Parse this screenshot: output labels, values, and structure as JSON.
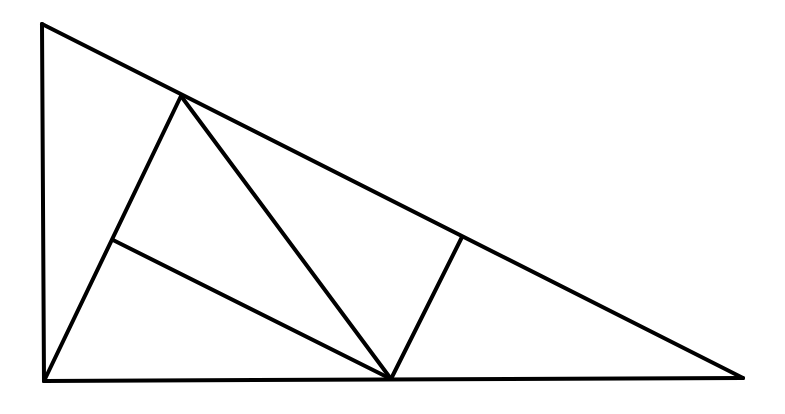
{
  "diagram": {
    "type": "geometry",
    "stroke_color": "#000000",
    "background_color": "#ffffff",
    "stroke_width": 4,
    "points": {
      "A": [
        42,
        24
      ],
      "B": [
        44,
        381
      ],
      "C": [
        743,
        378
      ],
      "P": [
        181,
        96
      ],
      "Q": [
        462,
        237
      ],
      "R": [
        391,
        379
      ],
      "S": [
        113,
        240
      ]
    },
    "segments": [
      {
        "name": "left-leg",
        "from": "A",
        "to": "B"
      },
      {
        "name": "base",
        "from": "B",
        "to": "C"
      },
      {
        "name": "hypotenuse",
        "from": "A",
        "to": "C"
      },
      {
        "name": "segment-b-p",
        "from": "B",
        "to": "P"
      },
      {
        "name": "segment-p-r",
        "from": "P",
        "to": "R"
      },
      {
        "name": "segment-s-r",
        "from": "S",
        "to": "R"
      },
      {
        "name": "segment-q-r",
        "from": "Q",
        "to": "R"
      }
    ]
  }
}
